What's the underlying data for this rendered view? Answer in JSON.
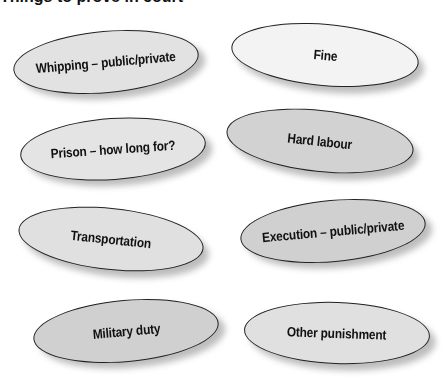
{
  "title": "Things to prove in court",
  "nodes": [
    {
      "label": "Whipping – public/private",
      "fill": "#e2e2e2",
      "x": 13,
      "y": 31,
      "w": 186,
      "h": 62,
      "rot": -5
    },
    {
      "label": "Fine",
      "fill": "#f3f3f3",
      "x": 231,
      "y": 24,
      "w": 188,
      "h": 62,
      "rot": 5
    },
    {
      "label": "Prison – how long for?",
      "fill": "#e4e4e4",
      "x": 20,
      "y": 118,
      "w": 186,
      "h": 62,
      "rot": -4
    },
    {
      "label": "Hard labour",
      "fill": "#d2d2d2",
      "x": 226,
      "y": 110,
      "w": 188,
      "h": 62,
      "rot": 6
    },
    {
      "label": "Transportation",
      "fill": "#e0e0e0",
      "x": 18,
      "y": 208,
      "w": 186,
      "h": 62,
      "rot": 6
    },
    {
      "label": "Execution – public/private",
      "fill": "#d0d0d0",
      "x": 240,
      "y": 200,
      "w": 186,
      "h": 62,
      "rot": -5
    },
    {
      "label": "Military duty",
      "fill": "#d0d0d0",
      "x": 33,
      "y": 300,
      "w": 186,
      "h": 62,
      "rot": -5
    },
    {
      "label": "Other punishment",
      "fill": "#e0e0e0",
      "x": 244,
      "y": 302,
      "w": 186,
      "h": 62,
      "rot": 2
    }
  ]
}
